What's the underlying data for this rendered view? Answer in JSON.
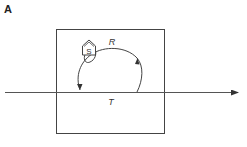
{
  "figure": {
    "panel_label": "A",
    "labels": {
      "house": "S",
      "loop": "R",
      "line": "T"
    },
    "colors": {
      "stroke": "#333333",
      "background": "#ffffff"
    }
  }
}
